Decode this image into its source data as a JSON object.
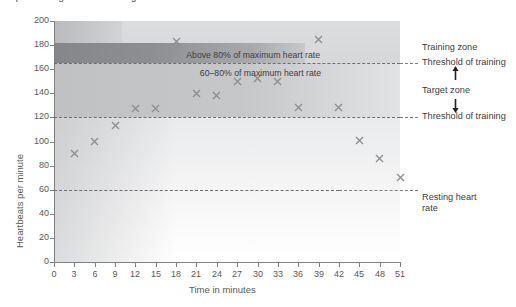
{
  "figure": {
    "cropped_caption_fragment": "Graph showing heart rate during exercise over time in minutes",
    "plot_area": {
      "x0": 54,
      "y0": 21,
      "x1": 400,
      "y1": 262
    }
  },
  "chart_data": {
    "type": "scatter",
    "title": "",
    "xlabel": "Time in minutes",
    "ylabel": "Heartbeats per minute",
    "xlim": [
      0,
      51
    ],
    "ylim": [
      0,
      200
    ],
    "xticks": [
      0,
      3,
      6,
      9,
      12,
      15,
      18,
      21,
      24,
      27,
      30,
      33,
      36,
      39,
      42,
      45,
      48,
      51
    ],
    "yticks": [
      0,
      20,
      40,
      60,
      80,
      100,
      120,
      140,
      160,
      180,
      200
    ],
    "grid": false,
    "marker": "x",
    "marker_color": "#8d8e91",
    "x": [
      3,
      6,
      9,
      12,
      15,
      18,
      21,
      24,
      27,
      30,
      33,
      36,
      39,
      42,
      45,
      48,
      51
    ],
    "values": [
      90,
      100,
      113,
      127,
      127,
      183,
      140,
      138,
      150,
      152,
      150,
      128,
      185,
      128,
      101,
      86,
      70
    ],
    "series": [
      {
        "name": "Heart rate",
        "x": [
          3,
          6,
          9,
          12,
          15,
          18,
          21,
          24,
          27,
          30,
          33,
          36,
          39,
          42,
          45,
          48,
          51
        ],
        "values": [
          90,
          100,
          113,
          127,
          127,
          183,
          140,
          138,
          150,
          152,
          150,
          128,
          185,
          128,
          101,
          86,
          70
        ]
      }
    ],
    "reference_lines": [
      {
        "name": "upper-threshold-of-training",
        "y": 165,
        "style": "dashed",
        "label": "Threshold of training"
      },
      {
        "name": "lower-threshold-of-training",
        "y": 120,
        "style": "dashed",
        "label": "Threshold of training"
      },
      {
        "name": "resting-heart-rate",
        "y": 60,
        "style": "dashed",
        "label": "Resting heart rate"
      }
    ],
    "bands": [
      {
        "name": "above-maximum",
        "y_from": 165,
        "y_to": 200,
        "color": "#d8d9da"
      },
      {
        "name": "above-80-percent-zone",
        "y_from": 165,
        "y_to": 200,
        "color": "#8d8e91",
        "note": "dark block left portion"
      },
      {
        "name": "target-zone-60-80-percent",
        "y_from": 120,
        "y_to": 165,
        "color": "#c3c4c6"
      },
      {
        "name": "below-target",
        "y_from": 0,
        "y_to": 120,
        "color": "#f1f1f2"
      }
    ],
    "annotations": [
      {
        "name": "above-80-annotation",
        "text": "Above 80% of maximum heart rate",
        "x": 39,
        "y": 172
      },
      {
        "name": "sixty-to-eighty-annotation",
        "text": "60–80% of maximum heart rate",
        "x": 39,
        "y": 158
      }
    ]
  },
  "right_labels": {
    "training_zone": "Training zone",
    "threshold_upper": "Threshold of training",
    "target_zone": "Target zone",
    "threshold_lower": "Threshold of training",
    "resting_heart_rate": "Resting heart\nrate",
    "resting_heart_rate_line1": "Resting heart",
    "resting_heart_rate_line2": "rate"
  },
  "axes": {
    "y_title": "Heartbeats per minute",
    "x_title": "Time in minutes"
  }
}
